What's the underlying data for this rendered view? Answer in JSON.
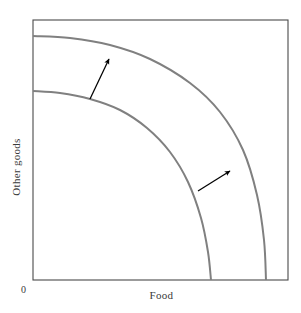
{
  "figure": {
    "type": "production-possibilities-frontier",
    "background_color": "#ffffff",
    "frame_color": "#4a4a4a",
    "curve_color": "#808080",
    "arrow_color": "#000000"
  },
  "axes": {
    "x_label": "Food",
    "y_label": "Other goods",
    "origin_label": "0"
  },
  "chart_data": {
    "type": "line",
    "title": "",
    "xlabel": "Food",
    "ylabel": "Other goods",
    "xlim": [
      0,
      256
    ],
    "ylim": [
      0,
      260
    ],
    "grid": false,
    "legend": "none",
    "plot_frame": {
      "left": 33,
      "top": 20,
      "right": 288,
      "bottom": 280
    },
    "series": [
      {
        "name": "Initial production possibilities frontier",
        "shape": "quarter-ellipse",
        "y_intercept_px": 91,
        "x_intercept_px": 211,
        "color": "#808080",
        "width_px": 2,
        "points": [
          [
            33,
            91
          ],
          [
            60,
            93
          ],
          [
            90,
            99
          ],
          [
            120,
            110
          ],
          [
            147,
            128
          ],
          [
            170,
            152
          ],
          [
            188,
            182
          ],
          [
            201,
            218
          ],
          [
            208,
            252
          ],
          [
            211,
            280
          ]
        ]
      },
      {
        "name": "Shifted outward production possibilities frontier",
        "shape": "quarter-ellipse",
        "y_intercept_px": 36,
        "x_intercept_px": 266,
        "color": "#808080",
        "width_px": 2,
        "points": [
          [
            33,
            36
          ],
          [
            70,
            38
          ],
          [
            110,
            45
          ],
          [
            150,
            59
          ],
          [
            190,
            83
          ],
          [
            220,
            112
          ],
          [
            243,
            150
          ],
          [
            257,
            195
          ],
          [
            264,
            240
          ],
          [
            266,
            280
          ]
        ]
      }
    ],
    "annotations": [
      {
        "name": "upper-shift-arrow",
        "type": "arrow",
        "from_px": [
          90,
          99
        ],
        "to_px": [
          109,
          59
        ],
        "color": "#000000",
        "label": ""
      },
      {
        "name": "lower-shift-arrow",
        "type": "arrow",
        "from_px": [
          198,
          191
        ],
        "to_px": [
          230,
          171
        ],
        "color": "#000000",
        "label": ""
      }
    ]
  }
}
